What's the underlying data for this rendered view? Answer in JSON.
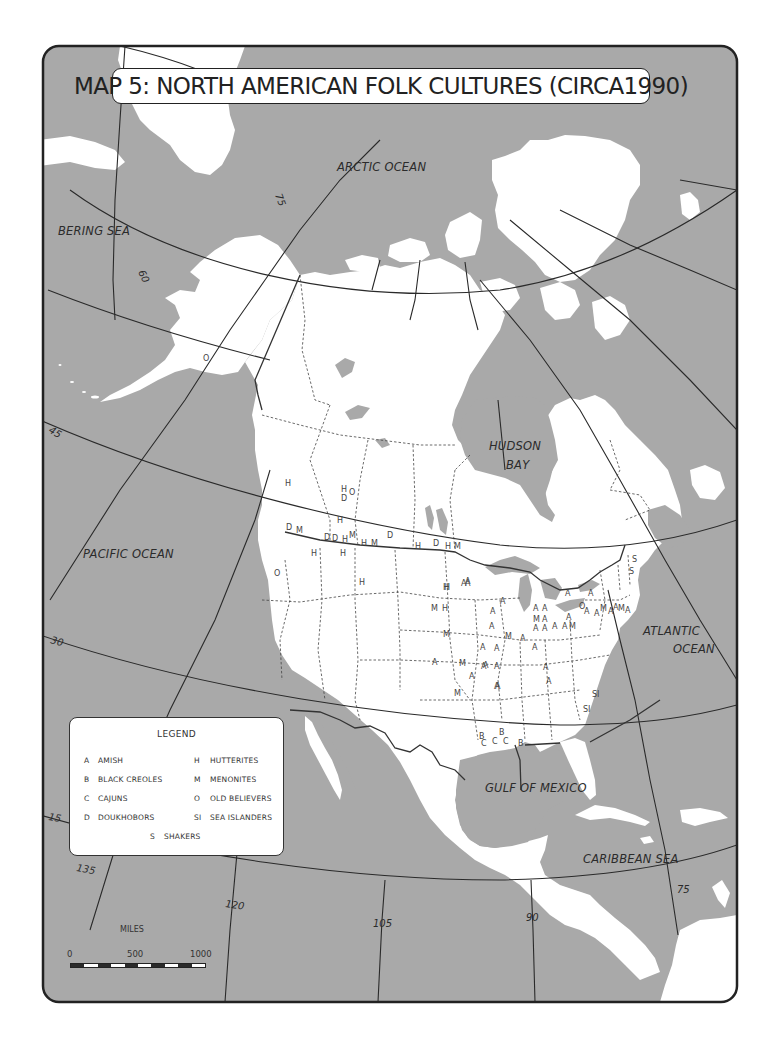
{
  "title": "MAP 5: NORTH AMERICAN FOLK CULTURES (CIRCA1990)",
  "colors": {
    "water": "#a9a9a9",
    "land": "#ffffff",
    "lines": "#2a2a2a",
    "frame": "#222222"
  },
  "water_labels": [
    {
      "id": "arctic",
      "text": "ARCTIC OCEAN",
      "x": 337,
      "y": 171
    },
    {
      "id": "bering",
      "text": "BERING SEA",
      "x": 58,
      "y": 235
    },
    {
      "id": "hudson1",
      "text": "HUDSON",
      "x": 489,
      "y": 450
    },
    {
      "id": "hudson2",
      "text": "BAY",
      "x": 506,
      "y": 469
    },
    {
      "id": "pacific",
      "text": "PACIFIC OCEAN",
      "x": 83,
      "y": 558
    },
    {
      "id": "atlantic1",
      "text": "ATLANTIC",
      "x": 643,
      "y": 635
    },
    {
      "id": "atlantic2",
      "text": "OCEAN",
      "x": 673,
      "y": 653
    },
    {
      "id": "gulf",
      "text": "GULF OF MEXICO",
      "x": 485,
      "y": 792
    },
    {
      "id": "caribbean",
      "text": "CARIBBEAN SEA",
      "x": 583,
      "y": 863
    }
  ],
  "graticule_labels": [
    {
      "text": "75",
      "x": 275,
      "y": 195,
      "rotate": 70
    },
    {
      "text": "60",
      "x": 138,
      "y": 272,
      "rotate": 65
    },
    {
      "text": "45",
      "x": 48,
      "y": 432,
      "rotate": 30
    },
    {
      "text": "30",
      "x": 50,
      "y": 643,
      "rotate": 15
    },
    {
      "text": "15",
      "x": 48,
      "y": 820,
      "rotate": 10
    },
    {
      "text": "135",
      "x": 76,
      "y": 871,
      "rotate": 10
    },
    {
      "text": "120",
      "x": 225,
      "y": 907,
      "rotate": 8
    },
    {
      "text": "105",
      "x": 373,
      "y": 927,
      "rotate": 0
    },
    {
      "text": "90",
      "x": 526,
      "y": 921,
      "rotate": 0
    },
    {
      "text": "75",
      "x": 677,
      "y": 893,
      "rotate": 0
    }
  ],
  "markers": [
    {
      "code": "O",
      "x": 203,
      "y": 361
    },
    {
      "code": "H",
      "x": 285,
      "y": 486
    },
    {
      "code": "H",
      "x": 341,
      "y": 492
    },
    {
      "code": "O",
      "x": 349,
      "y": 495
    },
    {
      "code": "D",
      "x": 341,
      "y": 501
    },
    {
      "code": "H",
      "x": 337,
      "y": 523
    },
    {
      "code": "D",
      "x": 286,
      "y": 530
    },
    {
      "code": "M",
      "x": 296,
      "y": 533
    },
    {
      "code": "D",
      "x": 324,
      "y": 540
    },
    {
      "code": "D",
      "x": 332,
      "y": 541
    },
    {
      "code": "H",
      "x": 342,
      "y": 542
    },
    {
      "code": "M",
      "x": 349,
      "y": 538
    },
    {
      "code": "H",
      "x": 361,
      "y": 546
    },
    {
      "code": "M",
      "x": 371,
      "y": 546
    },
    {
      "code": "D",
      "x": 387,
      "y": 538
    },
    {
      "code": "H",
      "x": 415,
      "y": 549
    },
    {
      "code": "D",
      "x": 433,
      "y": 546
    },
    {
      "code": "H",
      "x": 445,
      "y": 549
    },
    {
      "code": "M",
      "x": 454,
      "y": 549
    },
    {
      "code": "H",
      "x": 311,
      "y": 556
    },
    {
      "code": "H",
      "x": 340,
      "y": 556
    },
    {
      "code": "O",
      "x": 274,
      "y": 576
    },
    {
      "code": "H",
      "x": 359,
      "y": 585
    },
    {
      "code": "H",
      "x": 444,
      "y": 590
    },
    {
      "code": "A",
      "x": 465,
      "y": 586
    },
    {
      "code": "A",
      "x": 465,
      "y": 584
    },
    {
      "code": "H",
      "x": 443,
      "y": 590
    },
    {
      "code": "A",
      "x": 461,
      "y": 586
    },
    {
      "code": "H",
      "x": 443,
      "y": 590
    },
    {
      "code": "M",
      "x": 431,
      "y": 611
    },
    {
      "code": "H",
      "x": 442,
      "y": 611
    },
    {
      "code": "A",
      "x": 500,
      "y": 604
    },
    {
      "code": "A",
      "x": 490,
      "y": 614
    },
    {
      "code": "A",
      "x": 489,
      "y": 629
    },
    {
      "code": "M",
      "x": 443,
      "y": 637
    },
    {
      "code": "M",
      "x": 505,
      "y": 639
    },
    {
      "code": "A",
      "x": 520,
      "y": 641
    },
    {
      "code": "A",
      "x": 480,
      "y": 650
    },
    {
      "code": "A",
      "x": 494,
      "y": 651
    },
    {
      "code": "A",
      "x": 533,
      "y": 611
    },
    {
      "code": "A",
      "x": 542,
      "y": 611
    },
    {
      "code": "M",
      "x": 533,
      "y": 622
    },
    {
      "code": "A",
      "x": 542,
      "y": 622
    },
    {
      "code": "A",
      "x": 533,
      "y": 631
    },
    {
      "code": "A",
      "x": 542,
      "y": 631
    },
    {
      "code": "A",
      "x": 552,
      "y": 629
    },
    {
      "code": "A",
      "x": 562,
      "y": 629
    },
    {
      "code": "M",
      "x": 569,
      "y": 629
    },
    {
      "code": "A",
      "x": 566,
      "y": 620
    },
    {
      "code": "A",
      "x": 565,
      "y": 596
    },
    {
      "code": "A",
      "x": 588,
      "y": 596
    },
    {
      "code": "O",
      "x": 579,
      "y": 609
    },
    {
      "code": "A",
      "x": 584,
      "y": 614
    },
    {
      "code": "A",
      "x": 594,
      "y": 616
    },
    {
      "code": "M",
      "x": 600,
      "y": 611
    },
    {
      "code": "A",
      "x": 608,
      "y": 614
    },
    {
      "code": "A",
      "x": 613,
      "y": 610
    },
    {
      "code": "M",
      "x": 618,
      "y": 611
    },
    {
      "code": "A",
      "x": 625,
      "y": 613
    },
    {
      "code": "S",
      "x": 632,
      "y": 562
    },
    {
      "code": "S",
      "x": 629,
      "y": 574
    },
    {
      "code": "A",
      "x": 532,
      "y": 650
    },
    {
      "code": "A",
      "x": 543,
      "y": 670
    },
    {
      "code": "A",
      "x": 481,
      "y": 669
    },
    {
      "code": "A",
      "x": 494,
      "y": 669
    },
    {
      "code": "A",
      "x": 432,
      "y": 665
    },
    {
      "code": "M",
      "x": 459,
      "y": 666
    },
    {
      "code": "A",
      "x": 483,
      "y": 668
    },
    {
      "code": "A",
      "x": 469,
      "y": 679
    },
    {
      "code": "A",
      "x": 546,
      "y": 684
    },
    {
      "code": "A",
      "x": 495,
      "y": 689
    },
    {
      "code": "M",
      "x": 454,
      "y": 696
    },
    {
      "code": "A",
      "x": 494,
      "y": 689
    },
    {
      "code": "SI",
      "x": 592,
      "y": 697
    },
    {
      "code": "SI",
      "x": 583,
      "y": 712
    },
    {
      "code": "B",
      "x": 499,
      "y": 735
    },
    {
      "code": "B",
      "x": 479,
      "y": 739
    },
    {
      "code": "C",
      "x": 481,
      "y": 746
    },
    {
      "code": "C",
      "x": 492,
      "y": 744
    },
    {
      "code": "C",
      "x": 503,
      "y": 744
    },
    {
      "code": "B",
      "x": 518,
      "y": 746
    }
  ],
  "legend": {
    "title": "LEGEND",
    "items": [
      {
        "code": "A",
        "label": "AMISH"
      },
      {
        "code": "B",
        "label": "BLACK CREOLES"
      },
      {
        "code": "C",
        "label": "CAJUNS"
      },
      {
        "code": "D",
        "label": "DOUKHOBORS"
      },
      {
        "code": "H",
        "label": "HUTTERITES"
      },
      {
        "code": "M",
        "label": "MENONITES"
      },
      {
        "code": "O",
        "label": "OLD BELIEVERS"
      },
      {
        "code": "SI",
        "label": "SEA ISLANDERS"
      },
      {
        "code": "S",
        "label": "SHAKERS"
      }
    ]
  },
  "scale": {
    "title": "MILES",
    "ticks": [
      "0",
      "500",
      "1000"
    ]
  }
}
